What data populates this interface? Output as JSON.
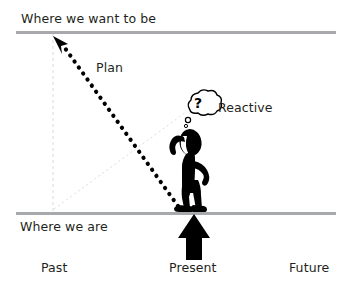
{
  "figure": {
    "title_text": "Where we want to be",
    "baseline_text": "Where we are",
    "plan_label": "Plan",
    "reactive_label": "Reactive",
    "thought_bubble_text": "?",
    "axis_labels": {
      "past": "Past",
      "present": "Present",
      "future": "Future"
    },
    "icons": {
      "plan_arrow": "dotted-diagonal-arrow-icon",
      "present_arrow": "up-arrow-icon",
      "person": "confused-person-icon",
      "thought_bubble": "thought-bubble-icon",
      "top_rule": "horizontal-rule-icon",
      "bottom_rule": "horizontal-rule-icon",
      "vertical_guide": "dashed-vertical-guide-icon",
      "reactive_guide": "dotted-guide-line-icon"
    },
    "colors": {
      "text": "#231f20",
      "rule": "#a7a9ac",
      "ink": "#000000",
      "guide": "#d6d6d6"
    }
  }
}
